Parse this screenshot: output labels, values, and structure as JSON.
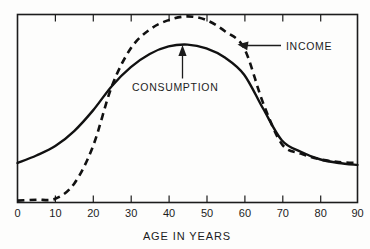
{
  "chart_data": {
    "type": "line",
    "title": "",
    "xlabel": "AGE IN YEARS",
    "ylabel": "",
    "xlim": [
      0,
      90
    ],
    "ylim": [
      0,
      100
    ],
    "grid": false,
    "legend_position": "inline-annotation",
    "xticks": [
      "0",
      "10",
      "20",
      "30",
      "40",
      "50",
      "60",
      "70",
      "80",
      "90"
    ],
    "xtick_values": [
      0,
      10,
      20,
      30,
      40,
      50,
      60,
      70,
      80,
      90
    ],
    "yticks": [],
    "x": [
      0,
      5,
      10,
      15,
      20,
      25,
      30,
      35,
      40,
      45,
      50,
      55,
      60,
      65,
      70,
      75,
      80,
      85,
      90
    ],
    "series": [
      {
        "name": "INCOME",
        "style": "dashed",
        "color": "#111111",
        "values": [
          1,
          1.5,
          2,
          10,
          30,
          62,
          82,
          92,
          97,
          99,
          97,
          91,
          82,
          53,
          31,
          26,
          23,
          21.5,
          21
        ]
      },
      {
        "name": "CONSUMPTION",
        "style": "solid",
        "color": "#111111",
        "values": [
          21,
          25,
          30,
          38,
          49,
          62,
          72,
          79,
          83,
          84,
          82,
          77,
          68,
          50,
          33,
          27,
          23,
          21,
          20
        ]
      }
    ],
    "annotations": [
      {
        "text": "INCOME",
        "target_series": "INCOME",
        "target_x": 59,
        "arrow": "left"
      },
      {
        "text": "CONSUMPTION",
        "target_series": "CONSUMPTION",
        "target_x": 44,
        "arrow": "up"
      }
    ]
  },
  "labels": {
    "xaxis_title": "AGE IN YEARS",
    "income": "INCOME",
    "consumption": "CONSUMPTION",
    "t0": "0",
    "t10": "10",
    "t20": "20",
    "t30": "30",
    "t40": "40",
    "t50": "50",
    "t60": "60",
    "t70": "70",
    "t80": "80",
    "t90": "90"
  },
  "colors": {
    "ink": "#111111",
    "background": "#fdfdfc"
  }
}
